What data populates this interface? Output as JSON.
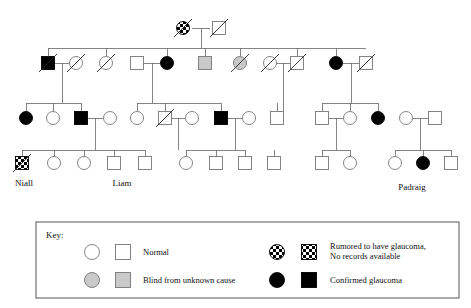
{
  "diagram": {
    "type": "pedigree",
    "colors": {
      "line": "#555555",
      "outline_dark": "#111111",
      "affected_fill": "#000000",
      "blind_fill": "#c9c9c9",
      "normal_fill": "#ffffff",
      "rumored_fill": "#000000",
      "background": "#ffffff"
    },
    "labels": [
      {
        "id": "label-niall",
        "text": "Niall",
        "x": 24,
        "y": 186
      },
      {
        "id": "label-liam",
        "text": "Liam",
        "x": 122,
        "y": 186
      },
      {
        "id": "label-padraig",
        "text": "Padraig",
        "x": 412,
        "y": 190
      }
    ],
    "generations": [
      {
        "name": "generation-i",
        "y": 28,
        "members": [
          {
            "id": "I-1",
            "sex": "female",
            "status": "rumored",
            "deceased": true,
            "x": 183
          },
          {
            "id": "I-2",
            "sex": "male",
            "status": "normal",
            "deceased": true,
            "x": 219
          }
        ]
      },
      {
        "name": "generation-ii",
        "y": 63,
        "members": [
          {
            "id": "II-1",
            "sex": "male",
            "status": "affected",
            "deceased": true,
            "x": 48
          },
          {
            "id": "II-2",
            "sex": "female",
            "status": "normal",
            "deceased": true,
            "x": 76
          },
          {
            "id": "II-3",
            "sex": "female",
            "status": "normal",
            "deceased": true,
            "x": 106
          },
          {
            "id": "II-4",
            "sex": "male",
            "status": "normal",
            "deceased": false,
            "x": 137
          },
          {
            "id": "II-5",
            "sex": "female",
            "status": "affected",
            "deceased": false,
            "x": 167
          },
          {
            "id": "II-6",
            "sex": "male",
            "status": "blind",
            "deceased": false,
            "x": 205
          },
          {
            "id": "II-7",
            "sex": "female",
            "status": "blind",
            "deceased": true,
            "x": 240
          },
          {
            "id": "II-8",
            "sex": "female",
            "status": "normal",
            "deceased": true,
            "x": 270
          },
          {
            "id": "II-9",
            "sex": "male",
            "status": "normal",
            "deceased": true,
            "x": 297
          },
          {
            "id": "II-10",
            "sex": "female",
            "status": "affected",
            "deceased": false,
            "x": 336
          },
          {
            "id": "II-11",
            "sex": "male",
            "status": "normal",
            "deceased": true,
            "x": 366
          }
        ]
      },
      {
        "name": "generation-iii",
        "y": 118,
        "members": [
          {
            "id": "III-1",
            "sex": "female",
            "status": "affected",
            "deceased": false,
            "x": 26
          },
          {
            "id": "III-2",
            "sex": "female",
            "status": "normal",
            "deceased": false,
            "x": 53
          },
          {
            "id": "III-3",
            "sex": "male",
            "status": "affected",
            "deceased": false,
            "x": 81
          },
          {
            "id": "III-4",
            "sex": "female",
            "status": "normal",
            "deceased": false,
            "x": 110
          },
          {
            "id": "III-5",
            "sex": "female",
            "status": "normal",
            "deceased": false,
            "x": 137
          },
          {
            "id": "III-6",
            "sex": "male",
            "status": "normal",
            "deceased": true,
            "x": 165
          },
          {
            "id": "III-7",
            "sex": "female",
            "status": "normal",
            "deceased": false,
            "x": 192
          },
          {
            "id": "III-8",
            "sex": "male",
            "status": "affected",
            "deceased": false,
            "x": 221
          },
          {
            "id": "III-9",
            "sex": "female",
            "status": "normal",
            "deceased": false,
            "x": 249
          },
          {
            "id": "III-10",
            "sex": "male",
            "status": "normal",
            "deceased": false,
            "x": 277
          },
          {
            "id": "III-11",
            "sex": "male",
            "status": "normal",
            "deceased": false,
            "x": 322
          },
          {
            "id": "III-12",
            "sex": "female",
            "status": "normal",
            "deceased": false,
            "x": 350
          },
          {
            "id": "III-13",
            "sex": "female",
            "status": "affected",
            "deceased": false,
            "x": 378
          },
          {
            "id": "III-14",
            "sex": "female",
            "status": "normal",
            "deceased": false,
            "x": 406
          },
          {
            "id": "III-15",
            "sex": "male",
            "status": "normal",
            "deceased": false,
            "x": 435
          }
        ]
      },
      {
        "name": "generation-iv",
        "y": 163,
        "members": [
          {
            "id": "IV-1",
            "sex": "male",
            "status": "rumored",
            "deceased": true,
            "x": 22,
            "label": "Niall"
          },
          {
            "id": "IV-2",
            "sex": "female",
            "status": "normal",
            "deceased": false,
            "x": 54
          },
          {
            "id": "IV-3",
            "sex": "female",
            "status": "normal",
            "deceased": false,
            "x": 84
          },
          {
            "id": "IV-4",
            "sex": "male",
            "status": "normal",
            "deceased": false,
            "x": 114
          },
          {
            "id": "IV-5",
            "sex": "male",
            "status": "normal",
            "deceased": false,
            "x": 145,
            "label": "Liam"
          },
          {
            "id": "IV-6",
            "sex": "female",
            "status": "normal",
            "deceased": false,
            "x": 186
          },
          {
            "id": "IV-7",
            "sex": "male",
            "status": "normal",
            "deceased": false,
            "x": 216
          },
          {
            "id": "IV-8",
            "sex": "male",
            "status": "normal",
            "deceased": false,
            "x": 245
          },
          {
            "id": "IV-9",
            "sex": "male",
            "status": "normal",
            "deceased": false,
            "x": 274
          },
          {
            "id": "IV-10",
            "sex": "male",
            "status": "normal",
            "deceased": false,
            "x": 322
          },
          {
            "id": "IV-11",
            "sex": "female",
            "status": "normal",
            "deceased": false,
            "x": 350
          },
          {
            "id": "IV-12",
            "sex": "female",
            "status": "normal",
            "deceased": false,
            "x": 395
          },
          {
            "id": "IV-13",
            "sex": "female",
            "status": "affected",
            "deceased": false,
            "x": 423,
            "label": "Padraig"
          },
          {
            "id": "IV-14",
            "sex": "male",
            "status": "normal",
            "deceased": false,
            "x": 451
          }
        ]
      }
    ]
  },
  "key": {
    "title": "Key:",
    "rows": [
      {
        "id": "key-normal",
        "label": "Normal",
        "circle_status": "normal",
        "square_status": "normal"
      },
      {
        "id": "key-blind",
        "label": "Blind from unknown cause",
        "circle_status": "blind",
        "square_status": "blind"
      },
      {
        "id": "key-rumored",
        "label": "Rumored to have glaucoma,",
        "label2": "No records available",
        "circle_status": "rumored",
        "square_status": "rumored"
      },
      {
        "id": "key-confirmed",
        "label": "Confirmed glaucoma",
        "circle_status": "affected",
        "square_status": "affected"
      }
    ]
  }
}
